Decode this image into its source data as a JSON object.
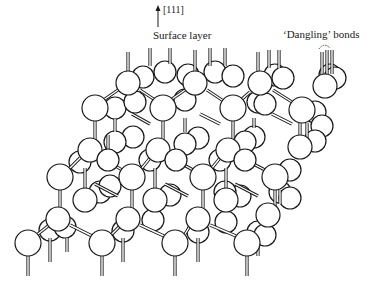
{
  "figure": {
    "labels": {
      "direction": "[111]",
      "surface_layer": "Surface layer",
      "dangling_bonds": "‘Dangling’ bonds"
    },
    "colors": {
      "stroke": "#1a1a1a",
      "fill": "#ffffff",
      "background": "#ffffff"
    },
    "arrow": {
      "x": 158,
      "y_top": 5,
      "y_bottom": 27
    },
    "back_spheres": [
      {
        "x": 143,
        "y": 77,
        "r": 11
      },
      {
        "x": 165,
        "y": 72,
        "r": 11
      },
      {
        "x": 188,
        "y": 75,
        "r": 11
      },
      {
        "x": 215,
        "y": 72,
        "r": 11
      },
      {
        "x": 233,
        "y": 76,
        "r": 11
      },
      {
        "x": 275,
        "y": 75,
        "r": 11
      },
      {
        "x": 283,
        "y": 78,
        "r": 11
      },
      {
        "x": 330,
        "y": 75,
        "r": 11
      },
      {
        "x": 335,
        "y": 78,
        "r": 11
      },
      {
        "x": 115,
        "y": 108,
        "r": 11
      },
      {
        "x": 135,
        "y": 102,
        "r": 11
      },
      {
        "x": 185,
        "y": 100,
        "r": 11
      },
      {
        "x": 258,
        "y": 102,
        "r": 11
      },
      {
        "x": 265,
        "y": 104,
        "r": 11
      },
      {
        "x": 315,
        "y": 112,
        "r": 11
      },
      {
        "x": 322,
        "y": 126,
        "r": 11
      },
      {
        "x": 133,
        "y": 137,
        "r": 11
      },
      {
        "x": 198,
        "y": 138,
        "r": 11
      },
      {
        "x": 254,
        "y": 137,
        "r": 11
      },
      {
        "x": 115,
        "y": 142,
        "r": 11
      },
      {
        "x": 185,
        "y": 144,
        "r": 11
      },
      {
        "x": 245,
        "y": 142,
        "r": 11
      },
      {
        "x": 315,
        "y": 141,
        "r": 11
      },
      {
        "x": 80,
        "y": 162,
        "r": 11
      },
      {
        "x": 150,
        "y": 160,
        "r": 11
      },
      {
        "x": 220,
        "y": 160,
        "r": 11
      },
      {
        "x": 290,
        "y": 170,
        "r": 11
      },
      {
        "x": 100,
        "y": 192,
        "r": 11
      },
      {
        "x": 170,
        "y": 195,
        "r": 11
      },
      {
        "x": 240,
        "y": 196,
        "r": 11
      },
      {
        "x": 110,
        "y": 186,
        "r": 11
      },
      {
        "x": 280,
        "y": 192,
        "r": 11
      },
      {
        "x": 290,
        "y": 198,
        "r": 11
      },
      {
        "x": 225,
        "y": 192,
        "r": 11
      },
      {
        "x": 50,
        "y": 230,
        "r": 11
      },
      {
        "x": 65,
        "y": 227,
        "r": 11
      },
      {
        "x": 123,
        "y": 231,
        "r": 11
      },
      {
        "x": 198,
        "y": 232,
        "r": 11
      },
      {
        "x": 258,
        "y": 232,
        "r": 11
      },
      {
        "x": 265,
        "y": 235,
        "r": 11
      },
      {
        "x": 153,
        "y": 220,
        "r": 11
      },
      {
        "x": 226,
        "y": 222,
        "r": 11
      }
    ],
    "mid_spheres": [
      {
        "x": 128,
        "y": 83,
        "r": 12
      },
      {
        "x": 195,
        "y": 83,
        "r": 12
      },
      {
        "x": 260,
        "y": 83,
        "r": 12
      },
      {
        "x": 325,
        "y": 86,
        "r": 12
      },
      {
        "x": 90,
        "y": 150,
        "r": 12
      },
      {
        "x": 158,
        "y": 150,
        "r": 12
      },
      {
        "x": 228,
        "y": 150,
        "r": 12
      },
      {
        "x": 300,
        "y": 147,
        "r": 12
      },
      {
        "x": 58,
        "y": 219,
        "r": 12
      },
      {
        "x": 128,
        "y": 219,
        "r": 12
      },
      {
        "x": 198,
        "y": 219,
        "r": 12
      },
      {
        "x": 268,
        "y": 215,
        "r": 12
      },
      {
        "x": 85,
        "y": 200,
        "r": 12
      },
      {
        "x": 155,
        "y": 200,
        "r": 12
      },
      {
        "x": 226,
        "y": 200,
        "r": 12
      },
      {
        "x": 108,
        "y": 160,
        "r": 11
      },
      {
        "x": 176,
        "y": 160,
        "r": 11
      },
      {
        "x": 245,
        "y": 160,
        "r": 11
      }
    ],
    "front_spheres": [
      {
        "x": 95,
        "y": 108,
        "r": 13
      },
      {
        "x": 163,
        "y": 108,
        "r": 13
      },
      {
        "x": 233,
        "y": 108,
        "r": 13
      },
      {
        "x": 302,
        "y": 110,
        "r": 13
      },
      {
        "x": 60,
        "y": 177,
        "r": 13
      },
      {
        "x": 132,
        "y": 177,
        "r": 13
      },
      {
        "x": 203,
        "y": 177,
        "r": 13
      },
      {
        "x": 275,
        "y": 177,
        "r": 13
      },
      {
        "x": 28,
        "y": 243,
        "r": 13
      },
      {
        "x": 102,
        "y": 243,
        "r": 13
      },
      {
        "x": 175,
        "y": 243,
        "r": 13
      },
      {
        "x": 247,
        "y": 243,
        "r": 13
      }
    ],
    "vertical_bonds": [
      {
        "x": 128,
        "y1": 52,
        "y2": 72
      },
      {
        "x": 150,
        "y1": 48,
        "y2": 66
      },
      {
        "x": 170,
        "y1": 48,
        "y2": 64
      },
      {
        "x": 195,
        "y1": 50,
        "y2": 72
      },
      {
        "x": 210,
        "y1": 48,
        "y2": 66
      },
      {
        "x": 225,
        "y1": 48,
        "y2": 66
      },
      {
        "x": 258,
        "y1": 52,
        "y2": 72
      },
      {
        "x": 269,
        "y1": 50,
        "y2": 68
      },
      {
        "x": 279,
        "y1": 50,
        "y2": 68
      },
      {
        "x": 322,
        "y1": 52,
        "y2": 76
      },
      {
        "x": 327,
        "y1": 50,
        "y2": 74
      },
      {
        "x": 332,
        "y1": 50,
        "y2": 74
      },
      {
        "x": 95,
        "y1": 121,
        "y2": 140
      },
      {
        "x": 115,
        "y1": 119,
        "y2": 132
      },
      {
        "x": 163,
        "y1": 121,
        "y2": 140
      },
      {
        "x": 185,
        "y1": 118,
        "y2": 132
      },
      {
        "x": 233,
        "y1": 121,
        "y2": 140
      },
      {
        "x": 254,
        "y1": 118,
        "y2": 128
      },
      {
        "x": 300,
        "y1": 123,
        "y2": 136
      },
      {
        "x": 307,
        "y1": 123,
        "y2": 140
      },
      {
        "x": 60,
        "y1": 190,
        "y2": 208
      },
      {
        "x": 85,
        "y1": 168,
        "y2": 190
      },
      {
        "x": 155,
        "y1": 168,
        "y2": 190
      },
      {
        "x": 132,
        "y1": 190,
        "y2": 208
      },
      {
        "x": 203,
        "y1": 190,
        "y2": 208
      },
      {
        "x": 226,
        "y1": 168,
        "y2": 190
      },
      {
        "x": 275,
        "y1": 190,
        "y2": 206
      },
      {
        "x": 280,
        "y1": 190,
        "y2": 204
      },
      {
        "x": 108,
        "y1": 135,
        "y2": 150
      },
      {
        "x": 28,
        "y1": 256,
        "y2": 276
      },
      {
        "x": 102,
        "y1": 256,
        "y2": 276
      },
      {
        "x": 175,
        "y1": 256,
        "y2": 276
      },
      {
        "x": 247,
        "y1": 256,
        "y2": 276
      },
      {
        "x": 50,
        "y1": 238,
        "y2": 262
      },
      {
        "x": 67,
        "y1": 238,
        "y2": 252
      },
      {
        "x": 123,
        "y1": 238,
        "y2": 262
      },
      {
        "x": 198,
        "y1": 238,
        "y2": 262
      },
      {
        "x": 258,
        "y1": 238,
        "y2": 256
      }
    ],
    "diagonal_bonds": [
      {
        "x1": 105,
        "y1": 99,
        "x2": 118,
        "y2": 90
      },
      {
        "x1": 140,
        "y1": 90,
        "x2": 155,
        "y2": 100
      },
      {
        "x1": 172,
        "y1": 99,
        "x2": 185,
        "y2": 90
      },
      {
        "x1": 207,
        "y1": 90,
        "x2": 222,
        "y2": 100
      },
      {
        "x1": 242,
        "y1": 99,
        "x2": 250,
        "y2": 92
      },
      {
        "x1": 273,
        "y1": 90,
        "x2": 292,
        "y2": 102
      },
      {
        "x1": 70,
        "y1": 168,
        "x2": 80,
        "y2": 158
      },
      {
        "x1": 101,
        "y1": 157,
        "x2": 122,
        "y2": 170
      },
      {
        "x1": 142,
        "y1": 168,
        "x2": 150,
        "y2": 158
      },
      {
        "x1": 170,
        "y1": 157,
        "x2": 193,
        "y2": 170
      },
      {
        "x1": 212,
        "y1": 168,
        "x2": 220,
        "y2": 158
      },
      {
        "x1": 240,
        "y1": 157,
        "x2": 265,
        "y2": 170
      },
      {
        "x1": 38,
        "y1": 234,
        "x2": 48,
        "y2": 226
      },
      {
        "x1": 70,
        "y1": 225,
        "x2": 92,
        "y2": 236
      },
      {
        "x1": 112,
        "y1": 234,
        "x2": 120,
        "y2": 226
      },
      {
        "x1": 140,
        "y1": 225,
        "x2": 164,
        "y2": 236
      },
      {
        "x1": 185,
        "y1": 234,
        "x2": 190,
        "y2": 226
      },
      {
        "x1": 210,
        "y1": 225,
        "x2": 236,
        "y2": 236
      },
      {
        "x1": 200,
        "y1": 114,
        "x2": 220,
        "y2": 124
      },
      {
        "x1": 272,
        "y1": 114,
        "x2": 292,
        "y2": 124
      },
      {
        "x1": 132,
        "y1": 114,
        "x2": 150,
        "y2": 124
      },
      {
        "x1": 165,
        "y1": 184,
        "x2": 188,
        "y2": 196
      },
      {
        "x1": 235,
        "y1": 184,
        "x2": 258,
        "y2": 196
      },
      {
        "x1": 95,
        "y1": 184,
        "x2": 118,
        "y2": 196
      }
    ]
  }
}
